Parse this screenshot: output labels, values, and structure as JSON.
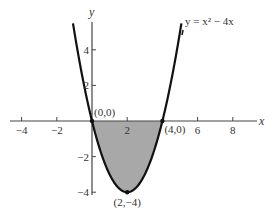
{
  "chart_data": {
    "type": "line",
    "title": "",
    "equation_label": "y = x² − 4x",
    "function": {
      "a": 1,
      "b": -4,
      "c": 0
    },
    "xlabel": "x",
    "ylabel": "y",
    "xlim": [
      -4.1,
      9.2
    ],
    "ylim": [
      -4.4,
      5.6
    ],
    "curve_domain": [
      -1.08,
      5.08
    ],
    "x_ticks": [
      -4,
      -2,
      2,
      6,
      8
    ],
    "x_tick_labels": [
      "−4",
      "−2",
      "2",
      "6",
      "8"
    ],
    "y_ticks": [
      4,
      2,
      -2,
      -4
    ],
    "y_tick_labels": [
      "4",
      "2",
      "−2",
      "−4"
    ],
    "shaded_region": {
      "from_x": 0,
      "to_x": 4,
      "between": "curve and x-axis",
      "color": "#a8a8a8"
    },
    "points": [
      {
        "x": 0,
        "y": 0,
        "label": "(0,0)"
      },
      {
        "x": 4,
        "y": 0,
        "label": "(4,0)"
      },
      {
        "x": 2,
        "y": -4,
        "label": "(2,−4)"
      }
    ],
    "grid": false,
    "legend": "none"
  },
  "colors": {
    "curve": "#111111",
    "axis": "#444444",
    "shade": "#a8a8a8",
    "text": "#333333"
  }
}
